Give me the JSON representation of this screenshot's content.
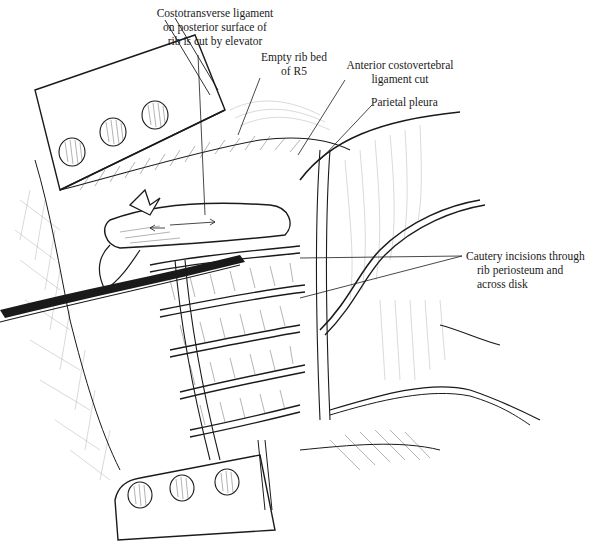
{
  "figure": {
    "type": "surgical-illustration",
    "caption_visible": "Figure 10-30 (partially cut off)",
    "colors": {
      "ink": "#1a1a1a",
      "background": "#ffffff"
    }
  },
  "labels": {
    "costotransverse": {
      "lines": [
        "Costotransverse ligament",
        "on posterior surface of",
        "rib is cut by elevator"
      ]
    },
    "empty_rib_bed": {
      "lines": [
        "Empty rib bed",
        "of R5"
      ]
    },
    "anterior_costovertebral": {
      "lines": [
        "Anterior costovertebral",
        "ligament cut"
      ]
    },
    "parietal_pleura": {
      "lines": [
        "Parietal pleura"
      ]
    },
    "cautery_incisions": {
      "lines": [
        "Cautery incisions through",
        "rib periosteum and",
        "across disk"
      ]
    }
  },
  "structures": {
    "upper_retractor": {
      "holes": 3
    },
    "lower_retractor": {
      "holes": 3
    },
    "elevator_instrument": "rib elevator",
    "rib_segments_visible": 5
  }
}
